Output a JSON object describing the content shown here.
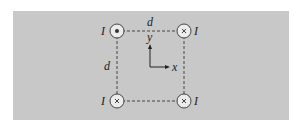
{
  "diagram": {
    "colors": {
      "panel": "#c8c8c8",
      "wire_fill": "#ececec",
      "line": "#333333"
    },
    "side_label_top": "d",
    "side_label_left": "d",
    "axes": {
      "x_label": "x",
      "y_label": "y"
    },
    "wires": [
      {
        "position": "top-left",
        "label": "I",
        "direction": "out of page",
        "symbol": "dot"
      },
      {
        "position": "top-right",
        "label": "I",
        "direction": "into page",
        "symbol": "cross"
      },
      {
        "position": "bottom-left",
        "label": "I",
        "direction": "into page",
        "symbol": "cross"
      },
      {
        "position": "bottom-right",
        "label": "I",
        "direction": "into page",
        "symbol": "cross"
      }
    ]
  }
}
